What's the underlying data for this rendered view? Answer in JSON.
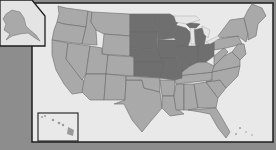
{
  "map": {
    "title": "United States map — Midwest region highlighted",
    "region_highlighted": "Midwest",
    "colors": {
      "background": "#8d8d8d",
      "ocean": "#e9e9e9",
      "other_states": "#a9a9a9",
      "highlighted_states": "#6f6f6f",
      "frame": "#1e1e1e",
      "state_border": "#6a6a6a"
    },
    "highlighted_states": [
      "North Dakota",
      "South Dakota",
      "Nebraska",
      "Kansas",
      "Minnesota",
      "Iowa",
      "Missouri",
      "Wisconsin",
      "Illinois",
      "Michigan",
      "Indiana",
      "Ohio"
    ],
    "insets": [
      {
        "name": "Alaska",
        "position": "top-left"
      },
      {
        "name": "Hawaii",
        "position": "bottom-left"
      }
    ]
  }
}
